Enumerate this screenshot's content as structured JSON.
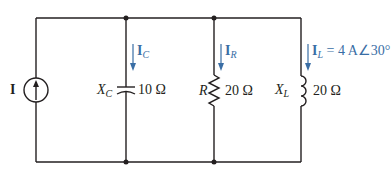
{
  "diagram": {
    "type": "parallel AC circuit",
    "colors": {
      "wire": "#231f20",
      "current_arrow": "#3a6ea5"
    },
    "source": {
      "label": "I",
      "type": "current-source",
      "direction": "up"
    },
    "branches": [
      {
        "id": "capacitor",
        "symbol": "X",
        "subscript": "C",
        "value": "10 Ω",
        "current": {
          "symbol": "I",
          "subscript": "C",
          "annotation": ""
        }
      },
      {
        "id": "resistor",
        "symbol": "R",
        "subscript": "",
        "value": "20 Ω",
        "current": {
          "symbol": "I",
          "subscript": "R",
          "annotation": ""
        }
      },
      {
        "id": "inductor",
        "symbol": "X",
        "subscript": "L",
        "value": "20 Ω",
        "current": {
          "symbol": "I",
          "subscript": "L",
          "annotation": " = 4 A∠30°"
        }
      }
    ]
  }
}
